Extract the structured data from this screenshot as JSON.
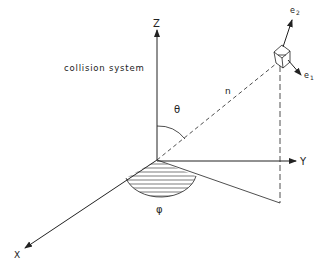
{
  "diagram": {
    "title_label": "collision system",
    "axes": {
      "z_label": "Z",
      "y_label": "Y",
      "x_label": "X"
    },
    "vector_label": "n",
    "polar_angle_label": "θ",
    "azimuth_label": "φ",
    "unit_vectors": {
      "e1_base": "e",
      "e1_sub": "1",
      "e2_base": "e",
      "e2_sub": "2"
    },
    "colors": {
      "line": "#222222",
      "background": "#ffffff"
    }
  }
}
